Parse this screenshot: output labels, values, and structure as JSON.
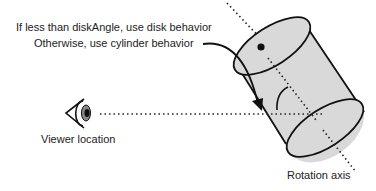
{
  "annotation": {
    "line1": "If less than diskAngle, use disk behavior",
    "line2": "Otherwise, use cylinder behavior"
  },
  "labels": {
    "viewer": "Viewer location",
    "rotation_axis": "Rotation axis"
  },
  "icons": {
    "eye": "eye-icon",
    "cylinder": "cylinder-shape",
    "arrow": "curved-arrow"
  },
  "colors": {
    "cylinder_fill": "#d9d9d9",
    "stroke": "#111111",
    "text": "#222222"
  }
}
